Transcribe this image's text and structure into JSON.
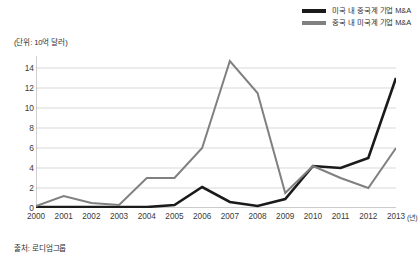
{
  "legend": {
    "items": [
      {
        "label": "미국 내 중국계 기업 M&A",
        "color": "#1a1a1a",
        "key": "series-a"
      },
      {
        "label": "중국 내 미국계 기업 M&A",
        "color": "#808080",
        "key": "series-b"
      }
    ]
  },
  "unit_note": "(단위: 10억 달러)",
  "source_note": "출처: 로디엄그룹",
  "x_axis_unit": "(년)",
  "chart_data": {
    "type": "line",
    "title": "",
    "subtitle": "",
    "xlabel": "(년)",
    "ylabel": "(단위: 10억 달러)",
    "categories": [
      "2000",
      "2001",
      "2002",
      "2003",
      "2004",
      "2005",
      "2006",
      "2007",
      "2008",
      "2009",
      "2010",
      "2011",
      "2012",
      "2013"
    ],
    "x": [
      2000,
      2001,
      2002,
      2003,
      2004,
      2005,
      2006,
      2007,
      2008,
      2009,
      2010,
      2011,
      2012,
      2013
    ],
    "series": [
      {
        "name": "미국 내 중국계 기업 M&A",
        "color": "#1a1a1a",
        "values": [
          0.1,
          0.1,
          0.1,
          0.1,
          0.1,
          0.3,
          2.1,
          0.6,
          0.2,
          0.9,
          4.2,
          4.0,
          5.0,
          13.0
        ]
      },
      {
        "name": "중국 내 미국계 기업 M&A",
        "color": "#808080",
        "values": [
          0.2,
          1.2,
          0.5,
          0.3,
          3.0,
          3.0,
          6.0,
          14.7,
          11.5,
          1.5,
          4.2,
          3.0,
          2.0,
          6.0
        ]
      }
    ],
    "ylim": [
      0,
      15.2
    ],
    "yticks": [
      0,
      2,
      4,
      6,
      8,
      10,
      12,
      14
    ],
    "ytick_labels": [
      "0",
      "2",
      "4",
      "6",
      "8",
      "10",
      "12",
      "14"
    ],
    "grid": true,
    "grid_axis": "y",
    "legend_position": "top-right"
  }
}
